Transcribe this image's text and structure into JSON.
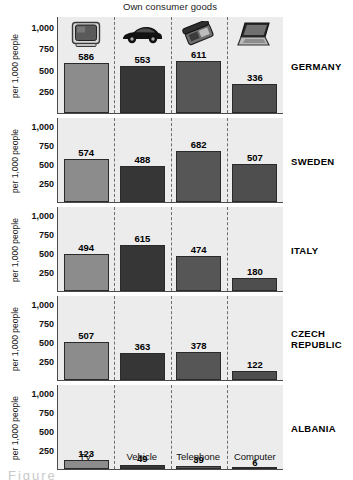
{
  "chart_data": {
    "type": "bar",
    "title": "Own consumer goods",
    "xlabel": "",
    "ylabel": "per 1,000 people",
    "ylim": [
      0,
      1125
    ],
    "yticks": [
      "1,000",
      "750",
      "500",
      "250"
    ],
    "ytick_values": [
      1000,
      750,
      500,
      250
    ],
    "grid": false,
    "legend": "none",
    "categories": [
      "TV",
      "Vehicle",
      "Telephone",
      "Computer"
    ],
    "panel_label_title": "Country",
    "series": [
      {
        "name": "GERMANY",
        "values": [
          586,
          553,
          611,
          336
        ]
      },
      {
        "name": "SWEDEN",
        "values": [
          574,
          488,
          682,
          507
        ]
      },
      {
        "name": "ITALY",
        "values": [
          494,
          615,
          474,
          180
        ]
      },
      {
        "name": "CZECH REPUBLIC",
        "values": [
          507,
          363,
          378,
          122
        ]
      },
      {
        "name": "ALBANIA",
        "values": [
          123,
          49,
          39,
          6
        ]
      }
    ],
    "category_icons": [
      "tv-icon",
      "car-icon",
      "telephone-icon",
      "laptop-icon"
    ],
    "bar_colors": [
      "#8c8c8c",
      "#363636",
      "#565656",
      "#4e4e4e"
    ],
    "panel_background": "#ececec",
    "divider_style": "dashed"
  },
  "caption_stub": "Figure"
}
